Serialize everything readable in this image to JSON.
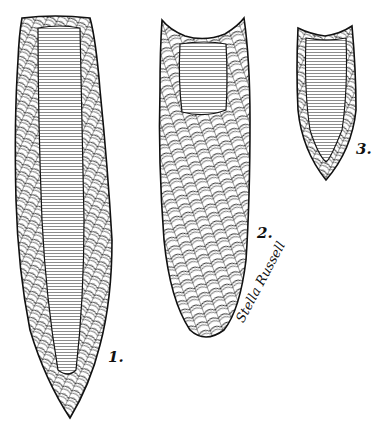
{
  "illustration": {
    "description": "Pen-and-ink drawing of three fluted projectile points",
    "points": [
      {
        "id": "point-1",
        "label": "1."
      },
      {
        "id": "point-2",
        "label": "2."
      },
      {
        "id": "point-3",
        "label": "3."
      }
    ],
    "signature": "Stella Russell",
    "colors": {
      "ink": "#111111",
      "paper": "#ffffff"
    }
  }
}
